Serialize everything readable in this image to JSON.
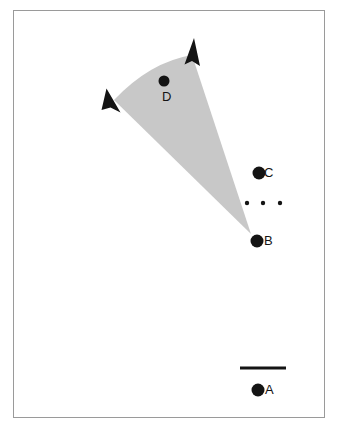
{
  "figure": {
    "background_color": "#ffffff",
    "frame_color": "#9a9a9a",
    "ink_color": "#141414",
    "wedge_fill": "#c8c8c8",
    "caption": ""
  },
  "chart_data": {
    "type": "scatter",
    "title": "",
    "subtitle": "",
    "xlabel": "",
    "ylabel": "",
    "grid": false,
    "legend": "none",
    "axis_visible": false,
    "xlim": [
      0,
      312
    ],
    "ylim": [
      0,
      408
    ],
    "points": [
      {
        "label": "A",
        "x": 258,
        "y": 390,
        "marker": "filled-circle",
        "radius": 6.5,
        "label_side": "right"
      },
      {
        "label": "B",
        "x": 257,
        "y": 241,
        "marker": "filled-circle",
        "radius": 6.5,
        "label_side": "right"
      },
      {
        "label": "C",
        "x": 259,
        "y": 173,
        "marker": "filled-circle",
        "radius": 6.5,
        "label_side": "right"
      },
      {
        "label": "D",
        "x": 164,
        "y": 81,
        "marker": "filled-circle",
        "radius": 5.5,
        "label_side": "below"
      }
    ],
    "ellipsis_dots": [
      {
        "x": 247,
        "y": 203,
        "radius": 2.2
      },
      {
        "x": 263,
        "y": 203,
        "radius": 2.2
      },
      {
        "x": 280,
        "y": 203,
        "radius": 2.2
      }
    ],
    "scale_bar": {
      "x1": 240,
      "x2": 286,
      "y": 368,
      "thickness": 3,
      "label": ""
    },
    "wedge": {
      "description": "shaded cone/fan emanating from apex near point B toward upper-left and upper-right, terminating in two arrowheads",
      "apex": {
        "x": 251,
        "y": 234
      },
      "arc_start": {
        "x": 114,
        "y": 100
      },
      "arc_end": {
        "x": 192,
        "y": 55
      },
      "arc_bulge": {
        "x": 150,
        "y": 62
      },
      "fill": "#c8c8c8"
    },
    "arrowheads": [
      {
        "tip_x": 108,
        "tip_y": 90,
        "angle_deg": -50,
        "direction": "upper-left"
      },
      {
        "tip_x": 193,
        "tip_y": 39,
        "angle_deg": 8,
        "direction": "up-slightly-right"
      }
    ]
  },
  "labels": {
    "A": "A",
    "B": "B",
    "C": "C",
    "D": "D"
  }
}
